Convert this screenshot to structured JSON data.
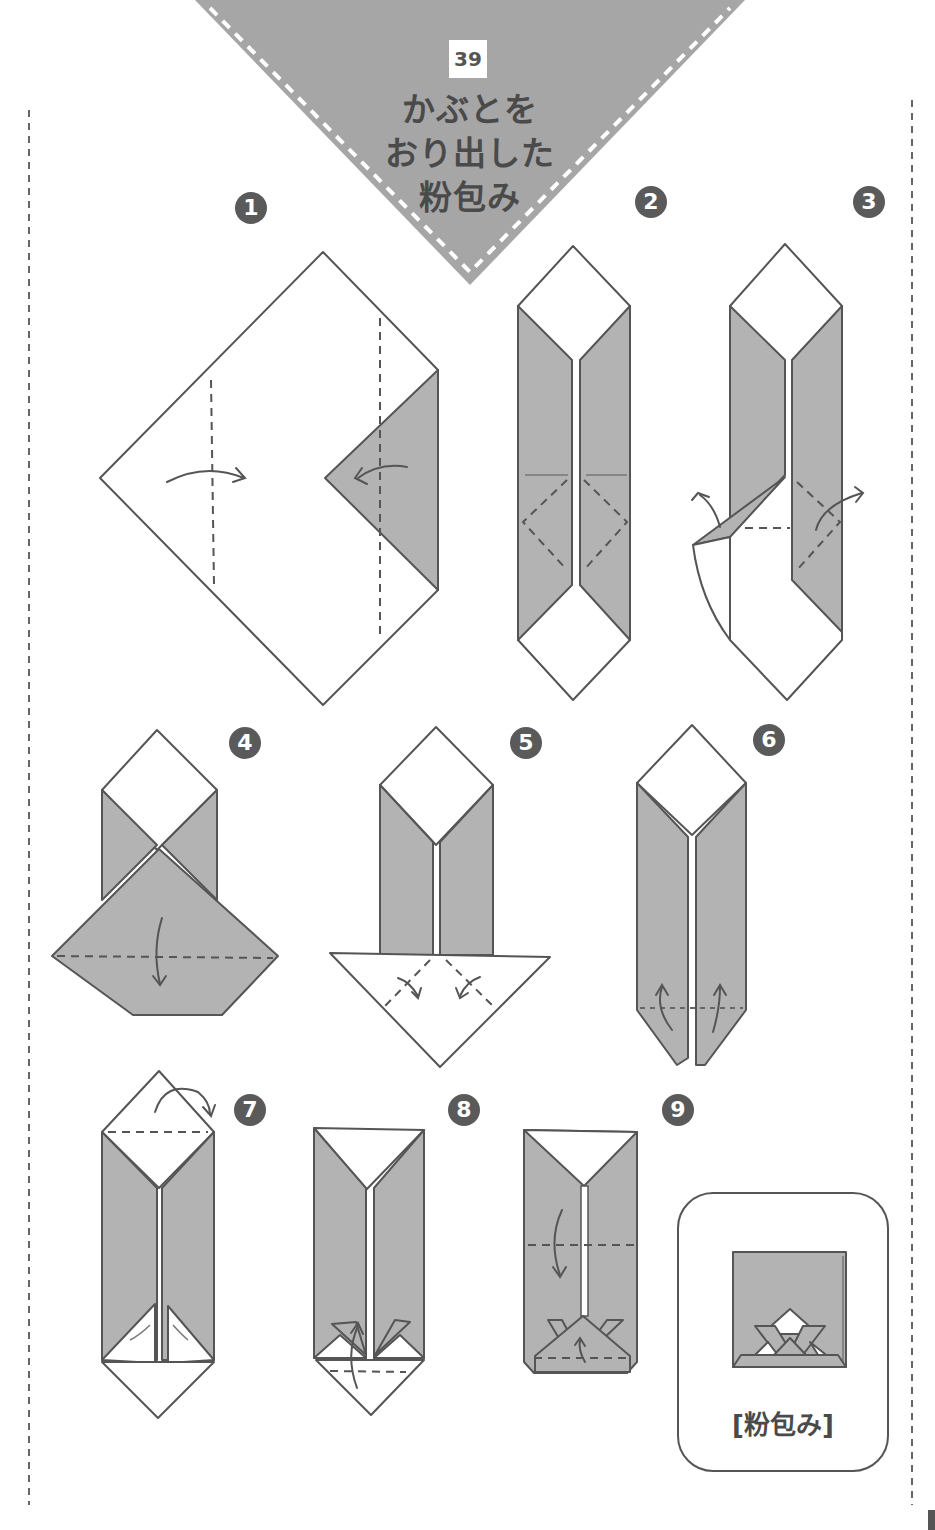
{
  "page": {
    "number": "39",
    "title_lines": [
      "かぶとを",
      "おり出した",
      "粉包み"
    ]
  },
  "colors": {
    "paper_gray": "#b3b3b3",
    "line": "#555555",
    "header_bg": "#a6a6a6",
    "step_badge": "#5a5a5a",
    "white": "#ffffff"
  },
  "steps": [
    {
      "number": "1",
      "label": "1"
    },
    {
      "number": "2",
      "label": "2"
    },
    {
      "number": "3",
      "label": "3"
    },
    {
      "number": "4",
      "label": "4"
    },
    {
      "number": "5",
      "label": "5"
    },
    {
      "number": "6",
      "label": "6"
    },
    {
      "number": "7",
      "label": "7"
    },
    {
      "number": "8",
      "label": "8"
    },
    {
      "number": "9",
      "label": "9"
    }
  ],
  "result": {
    "label": "[粉包み]"
  }
}
